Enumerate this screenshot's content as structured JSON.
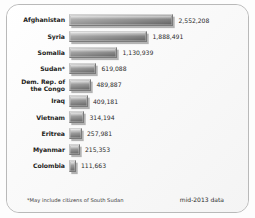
{
  "chart_data": {
    "type": "bar",
    "orientation": "horizontal",
    "title": "",
    "xlabel": "",
    "ylabel": "",
    "grid": false,
    "legend": null,
    "xlim": [
      0,
      2552208
    ],
    "categories": [
      "Afghanistan",
      "Syria",
      "Somalia",
      "Sudan*",
      "Dem. Rep. of the Congo",
      "Iraq",
      "Vietnam",
      "Eritrea",
      "Myanmar",
      "Colombia"
    ],
    "values": [
      2552208,
      1888491,
      1130939,
      619088,
      489887,
      409181,
      314194,
      257981,
      215353,
      111663
    ],
    "value_labels": [
      "2,552,208",
      "1,888,491",
      "1,130,939",
      "619,088",
      "489,887",
      "409,181",
      "314,194",
      "257,981",
      "215,353",
      "111,663"
    ],
    "annotations": [
      "*May include citizens of South Sudan",
      "mid-2013 data"
    ]
  },
  "rows": [
    {
      "label": "Afghanistan",
      "label_line1": "Afghanistan",
      "label_line2": "",
      "value_label": "2,552,208",
      "bar_px": 104
    },
    {
      "label": "Syria",
      "label_line1": "Syria",
      "label_line2": "",
      "value_label": "1,888,491",
      "bar_px": 78
    },
    {
      "label": "Somalia",
      "label_line1": "Somalia",
      "label_line2": "",
      "value_label": "1,130,939",
      "bar_px": 48
    },
    {
      "label": "Sudan*",
      "label_line1": "Sudan*",
      "label_line2": "",
      "value_label": "619,088",
      "bar_px": 27
    },
    {
      "label": "Dem. Rep. of the Congo",
      "label_line1": "Dem. Rep. of",
      "label_line2": "the Congo",
      "value_label": "489,887",
      "bar_px": 22
    },
    {
      "label": "Iraq",
      "label_line1": "Iraq",
      "label_line2": "",
      "value_label": "409,181",
      "bar_px": 18.5
    },
    {
      "label": "Vietnam",
      "label_line1": "Vietnam",
      "label_line2": "",
      "value_label": "314,194",
      "bar_px": 15
    },
    {
      "label": "Eritrea",
      "label_line1": "Eritrea",
      "label_line2": "",
      "value_label": "257,981",
      "bar_px": 12.5
    },
    {
      "label": "Myanmar",
      "label_line1": "Myanmar",
      "label_line2": "",
      "value_label": "215,353",
      "bar_px": 10.5
    },
    {
      "label": "Colombia",
      "label_line1": "Colombia",
      "label_line2": "",
      "value_label": "111,663",
      "bar_px": 6.5
    }
  ],
  "footnotes": {
    "left": "*May include citizens of South Sudan",
    "right": "mid-2013 data"
  },
  "colors": {
    "bar_light": "#c8c8c8",
    "bar_dark": "#5c5c5c",
    "frame_border": "#b9b9b9",
    "text": "#1d1d1b",
    "background": "#fbfbfb"
  }
}
